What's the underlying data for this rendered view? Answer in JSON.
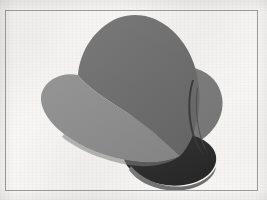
{
  "figure": {
    "title": "",
    "caption": "",
    "kind": "3d-surface-plot"
  },
  "canvas": {
    "width": 267,
    "height": 200
  },
  "frame": {
    "left": 5,
    "top": 10,
    "width": 253,
    "height": 181,
    "stroke_color": "#9b9b9b",
    "stroke_width": 1
  },
  "background": {
    "paper_color": "#f8f7f5",
    "texture": "scan-mottle"
  },
  "chart_data": {
    "type": "surface",
    "title": "",
    "xlabel": "",
    "ylabel": "",
    "legend": [],
    "grid": false,
    "axes_visible": false,
    "shading": "flat-facet-grayscale",
    "lobe_count": 3,
    "surfaces": [
      {
        "name": "upper-lobe-top-face",
        "shade_label": "dark-gray",
        "color": "#6e6e6e",
        "apex": [
          108,
          15
        ]
      },
      {
        "name": "right-lobe-face",
        "shade_label": "mid-gray",
        "color": "#7c7c7c",
        "extent_right": 222
      },
      {
        "name": "left-lobe-upper-face",
        "shade_label": "light-gray",
        "color": "#8e8e8e",
        "extent_left": 40
      },
      {
        "name": "bottom-lobe-inner-face",
        "shade_label": "near-black",
        "color": "#2e2e2e",
        "extent_bottom": 185
      },
      {
        "name": "bottom-lobe-rim",
        "shade_label": "mid-gray",
        "color": "#717171"
      },
      {
        "name": "right-crease-sliver",
        "shade_label": "dark-crease",
        "color": "#3a3a3a"
      }
    ],
    "palette": {
      "lightest": "#8e8e8e",
      "light_mid": "#858585",
      "mid": "#7c7c7c",
      "dark_mid": "#6e6e6e",
      "dark": "#4a4a4a",
      "darkest": "#2e2e2e"
    }
  }
}
